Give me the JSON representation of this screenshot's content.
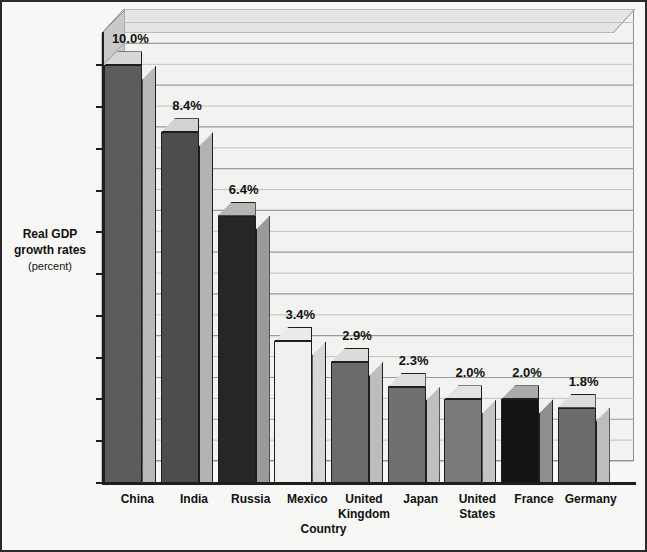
{
  "chart_data": {
    "type": "bar",
    "title": "",
    "xlabel": "Country",
    "ylabel": "Real GDP growth rates",
    "ylabel_unit": "(percent)",
    "ylim": [
      0,
      10.8
    ],
    "yticks": [
      0,
      1,
      2,
      3,
      4,
      5,
      6,
      7,
      8,
      9,
      10
    ],
    "ytick_labels": [
      "0",
      "1",
      "2",
      "3",
      "4",
      "5",
      "6",
      "7",
      "8",
      "9",
      "10"
    ],
    "minor_gridlines": true,
    "minor_step": 0.5,
    "grid": true,
    "legend": "none",
    "three_d": true,
    "categories": [
      "China",
      "India",
      "Russia",
      "Mexico",
      "United Kingdom",
      "Japan",
      "United States",
      "France",
      "Germany"
    ],
    "values": [
      10.0,
      8.4,
      6.4,
      3.4,
      2.9,
      2.3,
      2.0,
      2.0,
      1.8
    ],
    "data_labels": [
      "10.0%",
      "8.4%",
      "6.4%",
      "3.4%",
      "2.9%",
      "2.3%",
      "2.0%",
      "2.0%",
      "1.8%"
    ],
    "bar_colors": [
      "#5c5c5c",
      "#4d4d4d",
      "#262626",
      "#f0f0ee",
      "#6b6b6b",
      "#6f6f6f",
      "#7a7a7a",
      "#141414",
      "#6b6b6b"
    ],
    "bar_side_colors": [
      "#b9b9b7",
      "#b3b3b1",
      "#9a9a98",
      "#d7d7d5",
      "#bdbdbb",
      "#bfbfbd",
      "#c4c4c2",
      "#8f8f8d",
      "#bdbdbb"
    ],
    "bar_top_colors": [
      "#d8d8d6",
      "#d2d2d0",
      "#b6b6b4",
      "#eaeae8",
      "#dcdcda",
      "#dedede",
      "#e2e2e0",
      "#aaaaa8",
      "#dcdcda"
    ]
  },
  "colors": {
    "background": "#f7f7f5",
    "frame_border": "#2a2a2a",
    "plot_background": "#f2f2f0",
    "axis": "#1e1e1e",
    "gridline": "#9a9a9a",
    "gridline_minor": "#c0c0c0",
    "text": "#111111"
  }
}
